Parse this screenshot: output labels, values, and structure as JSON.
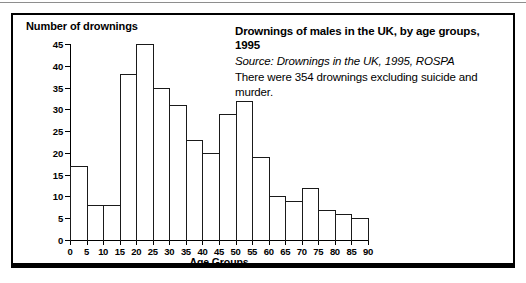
{
  "figure": {
    "y_axis_title": "Number of drownings",
    "x_axis_title": "Age Groups",
    "caption_title": "Drownings of males in the UK, by age groups, 1995",
    "caption_source": "Source: Drownings in the UK, 1995, ROSPA",
    "caption_note": "There were 354 drownings excluding suicide and murder."
  },
  "chart_data": {
    "type": "bar",
    "title": "Drownings of males in the UK, by age groups, 1995",
    "subtitle": "Source: Drownings in the UK, 1995, ROSPA",
    "annotation": "There were 354 drownings excluding suicide and murder.",
    "xlabel": "Age Groups",
    "ylabel": "Number of drownings",
    "xlim": [
      0,
      90
    ],
    "ylim": [
      0,
      45
    ],
    "xticks": [
      0,
      5,
      10,
      15,
      20,
      25,
      30,
      35,
      40,
      45,
      50,
      55,
      60,
      65,
      70,
      75,
      80,
      85,
      90
    ],
    "yticks": [
      0,
      5,
      10,
      15,
      20,
      25,
      30,
      35,
      40,
      45
    ],
    "grid": false,
    "legend": false,
    "bin_width": 5,
    "categories": [
      "0-5",
      "5-10",
      "10-15",
      "15-20",
      "20-25",
      "25-30",
      "30-35",
      "35-40",
      "40-45",
      "45-50",
      "50-55",
      "55-60",
      "60-65",
      "65-70",
      "70-75",
      "75-80",
      "80-85",
      "85-90"
    ],
    "bin_starts": [
      0,
      5,
      10,
      15,
      20,
      25,
      30,
      35,
      40,
      45,
      50,
      55,
      60,
      65,
      70,
      75,
      80,
      85
    ],
    "values": [
      17,
      8,
      8,
      38,
      45,
      35,
      31,
      23,
      20,
      29,
      32,
      19,
      10,
      9,
      12,
      7,
      6,
      5
    ],
    "total": 354,
    "colors": {
      "bar_outline": "#1a1a1a",
      "bar_fill": "none",
      "axis": "#000000",
      "background": "#ffffff"
    }
  }
}
